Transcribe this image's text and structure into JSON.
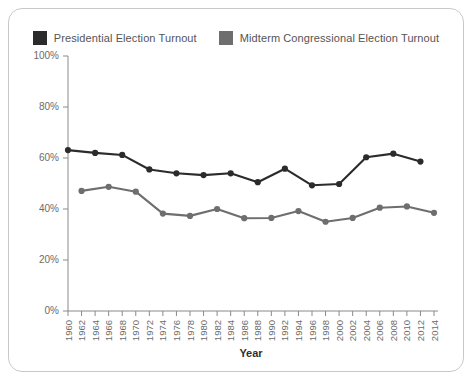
{
  "chart_data": {
    "type": "line",
    "title": "",
    "xlabel": "Year",
    "ylabel": "",
    "grid": false,
    "legend_position": "top-center",
    "xlim": [
      1960,
      2014
    ],
    "ylim": [
      0,
      100
    ],
    "ytick_labels": [
      "100%",
      "80%",
      "60%",
      "40%",
      "20%",
      "0%"
    ],
    "ytick_values": [
      100,
      80,
      60,
      40,
      20,
      0
    ],
    "x": [
      1960,
      1962,
      1964,
      1966,
      1968,
      1970,
      1972,
      1974,
      1976,
      1978,
      1980,
      1982,
      1984,
      1986,
      1988,
      1990,
      1992,
      1994,
      1996,
      1998,
      2000,
      2002,
      2004,
      2006,
      2008,
      2010,
      2012,
      2014
    ],
    "xtick_labels": [
      "1960",
      "1962",
      "1964",
      "1966",
      "1968",
      "1970",
      "1972",
      "1974",
      "1976",
      "1978",
      "1980",
      "1982",
      "1984",
      "1986",
      "1988",
      "1990",
      "1992",
      "1994",
      "1996",
      "1998",
      "2000",
      "2002",
      "2004",
      "2006",
      "2008",
      "2010",
      "2012",
      "2014"
    ],
    "series": [
      {
        "name": "Presidential Election Turnout",
        "color": "#2b2b2b",
        "x": [
          1960,
          1964,
          1968,
          1972,
          1976,
          1980,
          1984,
          1988,
          1992,
          1996,
          2000,
          2004,
          2008,
          2012
        ],
        "values": [
          63.1,
          62.0,
          61.2,
          55.5,
          54.0,
          53.3,
          54.0,
          50.5,
          55.8,
          49.3,
          49.8,
          60.3,
          61.7,
          58.6
        ]
      },
      {
        "name": "Midterm Congressional Election Turnout",
        "color": "#6e6e6e",
        "x": [
          1962,
          1966,
          1970,
          1974,
          1978,
          1982,
          1986,
          1990,
          1994,
          1998,
          2002,
          2006,
          2010,
          2014
        ],
        "values": [
          47.1,
          48.7,
          46.8,
          38.2,
          37.3,
          40.0,
          36.4,
          36.5,
          39.2,
          35.0,
          36.5,
          40.5,
          41.0,
          38.5
        ]
      }
    ]
  },
  "legend": {
    "entries": [
      {
        "label": "Presidential Election Turnout",
        "color": "#2b2b2b"
      },
      {
        "label": "Midterm Congressional Election Turnout",
        "color": "#6e6e6e"
      }
    ]
  }
}
